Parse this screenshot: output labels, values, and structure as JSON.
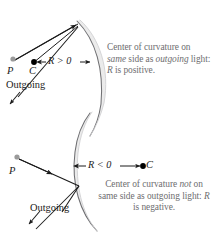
{
  "figure": {
    "background_color": "#ffffff",
    "mirror_fill": "#ebebeb",
    "mirror_stroke": "#8a8a8a",
    "ray_color": "#1b1b1b",
    "caption_color": "#6e6e70",
    "point_p_color": "#9a9a9a",
    "point_c_color": "#000000"
  },
  "panels": [
    {
      "id": "positive-radius",
      "labels": {
        "point_p": "P",
        "point_c": "C",
        "radius": "R > 0",
        "outgoing": "Outgoing"
      },
      "caption": {
        "line1_a": "Center of curvature on",
        "line2_a": "same",
        "line2_b": " side as ",
        "line2_c": "outgoing",
        "line3_a": "light: ",
        "line3_r": "R",
        "line3_b": " is positive."
      },
      "sign": "positive",
      "radius_value": "R > 0"
    },
    {
      "id": "negative-radius",
      "labels": {
        "point_p": "P",
        "point_c": "C",
        "radius": "R < 0",
        "outgoing": "Outgoing"
      },
      "caption": {
        "line1_a": "Center of curvature ",
        "line1_not": "not",
        "line1_b": " on",
        "line2_a": "same side as outgoing",
        "line3_a": "light: ",
        "line3_r": "R",
        "line3_b": " is negative."
      },
      "sign": "negative",
      "radius_value": "R < 0"
    }
  ]
}
